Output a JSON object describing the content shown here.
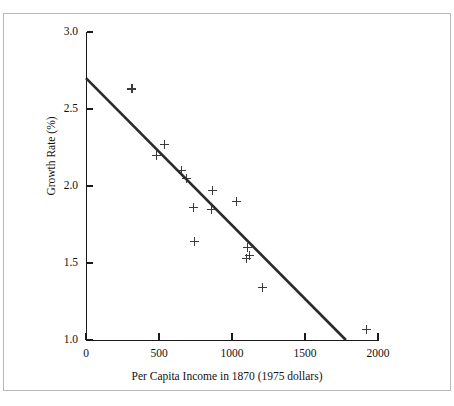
{
  "chart_data": {
    "type": "scatter",
    "title": "",
    "xlabel": "Per Capita Income in 1870 (1975 dollars)",
    "ylabel": "Growth Rate (%)",
    "xlim": [
      0,
      2000
    ],
    "ylim": [
      1.0,
      3.0
    ],
    "xticks": [
      0,
      500,
      1000,
      1500,
      2000
    ],
    "xtick_labels": [
      "0",
      "500",
      "1000",
      "1500",
      "2000"
    ],
    "yticks": [
      1.0,
      1.5,
      2.0,
      2.5,
      3.0
    ],
    "ytick_labels": [
      "1.0",
      "1.5",
      "2.0",
      "2.5",
      "3.0"
    ],
    "grid": false,
    "legend": false,
    "marker": "plus",
    "marker_color": "#3a3a3a",
    "series": [
      {
        "name": "Countries",
        "points": [
          {
            "x": 315,
            "y": 2.63
          },
          {
            "x": 485,
            "y": 2.2
          },
          {
            "x": 540,
            "y": 2.27
          },
          {
            "x": 655,
            "y": 2.1
          },
          {
            "x": 690,
            "y": 2.05
          },
          {
            "x": 735,
            "y": 1.86
          },
          {
            "x": 740,
            "y": 1.64
          },
          {
            "x": 860,
            "y": 1.85
          },
          {
            "x": 865,
            "y": 1.97
          },
          {
            "x": 1030,
            "y": 1.9
          },
          {
            "x": 1105,
            "y": 1.6
          },
          {
            "x": 1100,
            "y": 1.53
          },
          {
            "x": 1120,
            "y": 1.55
          },
          {
            "x": 1210,
            "y": 1.34
          },
          {
            "x": 1920,
            "y": 1.07
          }
        ]
      }
    ],
    "trend_line": {
      "name": "regression-line",
      "color": "#2a2a2a",
      "width": 2.6,
      "x_start": 0,
      "y_start": 2.7,
      "x_end": 1780,
      "y_end": 1.0
    }
  }
}
